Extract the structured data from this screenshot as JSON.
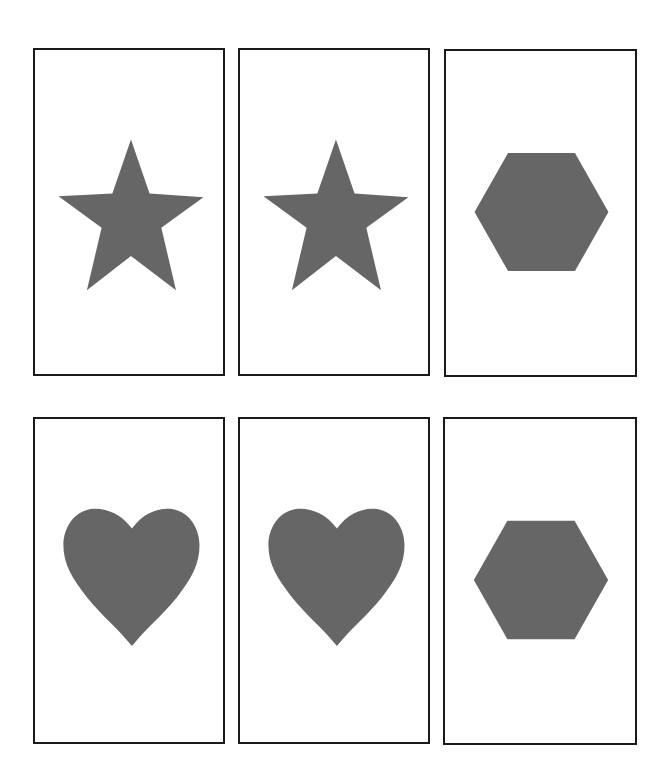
{
  "board": {
    "shape_color": "#666666",
    "border_color": "#1a1a1a",
    "cards": [
      {
        "id": 1,
        "shape": "star",
        "left": 33,
        "top": 48,
        "width": 192,
        "height": 328
      },
      {
        "id": 2,
        "shape": "star",
        "left": 238,
        "top": 48,
        "width": 192,
        "height": 328
      },
      {
        "id": 3,
        "shape": "hexagon",
        "left": 444,
        "top": 49,
        "width": 193,
        "height": 328
      },
      {
        "id": 4,
        "shape": "heart",
        "left": 33,
        "top": 417,
        "width": 192,
        "height": 327
      },
      {
        "id": 5,
        "shape": "heart",
        "left": 238,
        "top": 417,
        "width": 192,
        "height": 327
      },
      {
        "id": 6,
        "shape": "hexagon",
        "left": 443,
        "top": 417,
        "width": 194,
        "height": 328
      }
    ]
  }
}
